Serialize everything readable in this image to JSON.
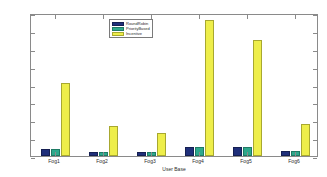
{
  "chart_data": {
    "type": "bar",
    "title": "",
    "xlabel": "User Base",
    "ylabel": "Processing Time (ms)",
    "categories": [
      "Fog1",
      "Fog2",
      "Fog3",
      "Fog4",
      "Fog5",
      "Fog6"
    ],
    "series": [
      {
        "name": "RoundRobin",
        "color": "#1f2f7a",
        "values": [
          4,
          2,
          2,
          5,
          5,
          3
        ]
      },
      {
        "name": "PriorityBased",
        "color": "#2ea88c",
        "values": [
          4,
          2,
          2,
          5,
          5,
          3
        ]
      },
      {
        "name": "Incentive",
        "color": "#eeee4a",
        "values": [
          41,
          17,
          13,
          76,
          65,
          18
        ]
      }
    ],
    "ylim": [
      0,
      80
    ],
    "yticks": [
      0,
      10,
      20,
      30,
      40,
      50,
      60,
      70,
      80
    ],
    "ytick_labels": [
      "0",
      "10",
      "20",
      "30",
      "40",
      "50",
      "60",
      "70",
      "80"
    ],
    "grid": false,
    "legend_position": "top-left-inside"
  }
}
